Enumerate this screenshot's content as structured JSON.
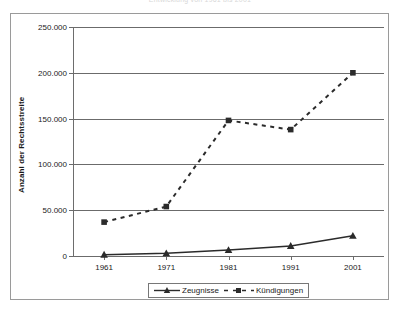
{
  "chart_data": {
    "type": "line",
    "title": "Entwicklung von 1961 bis 2001",
    "xlabel": "",
    "ylabel": "Anzahl der Rechtsstreite",
    "x": [
      1961,
      1971,
      1981,
      1991,
      2001
    ],
    "xtick_labels": [
      "1961",
      "1971",
      "1981",
      "1991",
      "2001"
    ],
    "ytick_labels": [
      "0",
      "50.000",
      "100.000",
      "150.000",
      "200.000",
      "250.000"
    ],
    "ytick_values": [
      0,
      50000,
      100000,
      150000,
      200000,
      250000
    ],
    "ylim": [
      0,
      250000
    ],
    "grid": "horizontal",
    "legend_position": "bottom",
    "series": [
      {
        "name": "Zeugnisse",
        "marker": "triangle",
        "linestyle": "solid",
        "color": "#2b2b2b",
        "values": [
          1500,
          3000,
          6500,
          11000,
          22000
        ]
      },
      {
        "name": "Kündigungen",
        "marker": "square",
        "linestyle": "dashed",
        "color": "#2b2b2b",
        "values": [
          37000,
          54000,
          148000,
          138000,
          200000
        ]
      }
    ]
  },
  "legend": {
    "items": [
      {
        "label": "Zeugnisse"
      },
      {
        "label": "Kündigungen"
      }
    ]
  }
}
